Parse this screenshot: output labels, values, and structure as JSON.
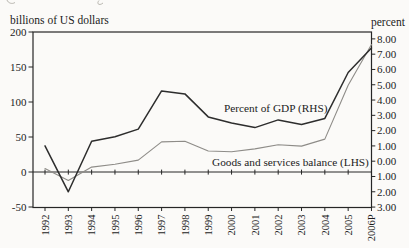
{
  "figure": {
    "background": "#fbfaf8",
    "cropped_caption_remnant": "partial descenders of cut-off text at top edge"
  },
  "chart_data": {
    "type": "line",
    "categories": [
      "1992",
      "1993",
      "1994",
      "1995",
      "1996",
      "1997",
      "1998",
      "1999",
      "2000",
      "2001",
      "2002",
      "2003",
      "2004",
      "2005",
      "2006P"
    ],
    "series": [
      {
        "name": "Goods and services balance (LHS)",
        "axis": "left",
        "unit": "billions of US dollars",
        "color": "#8e8c88",
        "width": 1.1,
        "values": [
          5,
          -12,
          7,
          11,
          17,
          43,
          44,
          30,
          29,
          33,
          39,
          37,
          47,
          124,
          182
        ]
      },
      {
        "name": "Percent of GDP (RHS)",
        "axis": "right",
        "unit": "percent",
        "color": "#2d2d2d",
        "width": 1.5,
        "values": [
          1.0,
          -2.0,
          1.3,
          1.6,
          2.1,
          4.6,
          4.4,
          2.9,
          2.5,
          2.2,
          2.7,
          2.4,
          2.8,
          5.8,
          7.4
        ]
      }
    ],
    "left_axis": {
      "label": "billions of US dollars",
      "tick_labels": [
        "200",
        "150",
        "100",
        "50",
        "0",
        "-50"
      ],
      "tick_values": [
        200,
        150,
        100,
        50,
        0,
        -50
      ],
      "range": [
        -50,
        200
      ]
    },
    "right_axis": {
      "label": "percent",
      "tick_labels": [
        "8.00",
        "7.00",
        "6.00",
        "5.00",
        "4.00",
        "3.00",
        "2.00",
        "1.00",
        "0.00",
        "1.00",
        "2.00",
        "3.00"
      ],
      "tick_values": [
        8,
        7,
        6,
        5,
        4,
        3,
        2,
        1,
        0,
        -1,
        -2,
        -3
      ],
      "range": [
        -3,
        8
      ]
    },
    "x_axis": {
      "zero_line": true,
      "grid": false
    },
    "annotations": [
      {
        "text": "Percent of GDP (RHS)"
      },
      {
        "text": "Goods and services balance (LHS)"
      }
    ],
    "axis_color": "#262626"
  }
}
